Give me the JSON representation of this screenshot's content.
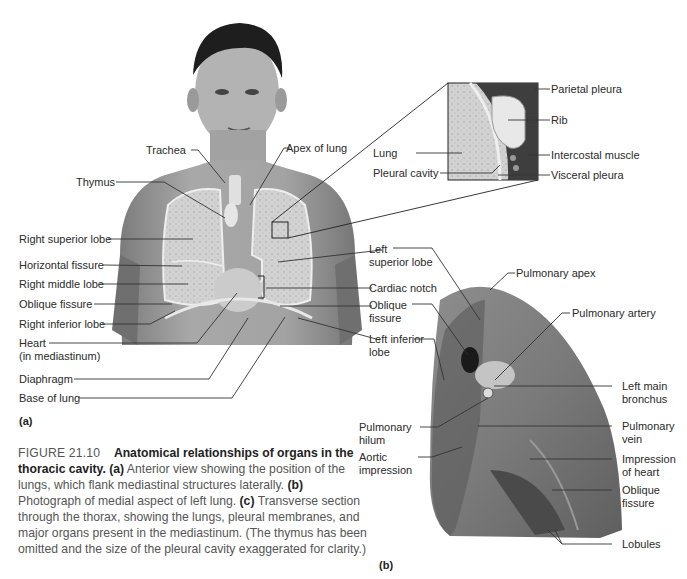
{
  "figure": {
    "number": "FIGURE 21.10",
    "title": "Anatomical relationships of organs in the thoracic cavity.",
    "caption_parts": [
      {
        "marker": "(a)",
        "text": " Anterior view showing the position of the lungs, which flank mediastinal structures laterally."
      },
      {
        "marker": "(b)",
        "text": " Photograph of medial aspect of left lung."
      },
      {
        "marker": "(c)",
        "text": " Transverse section through the thorax, showing the lungs, pleural membranes, and major organs present in the mediastinum. (The thymus has been omitted and the size of the pleural cavity exaggerated for clarity.)"
      }
    ]
  },
  "panel_a": {
    "label": "(a)",
    "left_labels": [
      "Trachea",
      "Thymus",
      "Right superior lobe",
      "Horizontal fissure",
      "Right middle lobe",
      "Oblique fissure",
      "Right inferior lobe",
      "Heart",
      "(in mediastinum)",
      "Diaphragm",
      "Base of lung"
    ],
    "right_labels": [
      "Apex of lung",
      "Left",
      "superior lobe",
      "Cardiac notch",
      "Oblique",
      "fissure",
      "Left inferior",
      "lobe"
    ],
    "inset_labels": {
      "left": [
        "Lung",
        "Pleural cavity"
      ],
      "right": [
        "Parietal pleura",
        "Rib",
        "Intercostal muscle",
        "Visceral pleura"
      ]
    }
  },
  "panel_b": {
    "label": "(b)",
    "left_labels": [
      "Pulmonary",
      "hilum",
      "Aortic",
      "impression"
    ],
    "right_labels": [
      "Pulmonary apex",
      "Pulmonary artery",
      "Left main",
      "bronchus",
      "Pulmonary",
      "vein",
      "Impression",
      "of heart",
      "Oblique",
      "fissure",
      "Lobules"
    ]
  },
  "colors": {
    "leader_line": "#333333",
    "skin": "#9a9a9a",
    "lung": "#cfcfcf",
    "caption_text": "#555555"
  }
}
